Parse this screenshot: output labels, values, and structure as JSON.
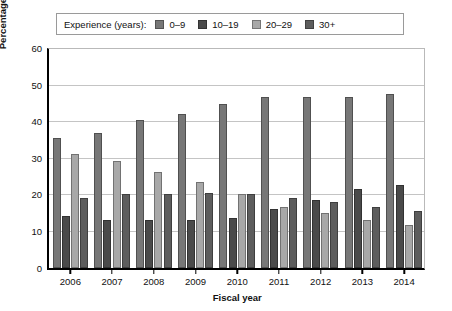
{
  "chart_data": {
    "type": "bar",
    "title": "",
    "xlabel": "Fiscal year",
    "ylabel": "Percentage of total civilian workforce",
    "categories": [
      "2006",
      "2007",
      "2008",
      "2009",
      "2010",
      "2011",
      "2012",
      "2013",
      "2014"
    ],
    "ylim": [
      0,
      60
    ],
    "yticks": [
      0,
      10,
      20,
      30,
      40,
      50,
      60
    ],
    "grid": true,
    "legend_position": "top",
    "legend_title": "Experience (years):",
    "series": [
      {
        "name": "0–9",
        "color": "#777777",
        "values": [
          35.5,
          36.7,
          40.3,
          42.0,
          44.8,
          46.5,
          46.7,
          46.7,
          47.5
        ]
      },
      {
        "name": "10–19",
        "color": "#4a4a4a",
        "values": [
          14.0,
          13.0,
          13.0,
          13.0,
          13.5,
          16.0,
          18.5,
          21.5,
          22.5
        ]
      },
      {
        "name": "20–29",
        "color": "#a8a8a8",
        "values": [
          31.0,
          29.0,
          26.0,
          23.5,
          20.0,
          16.5,
          15.0,
          13.0,
          11.5
        ]
      },
      {
        "name": "30+",
        "color": "#5d5d5d",
        "values": [
          19.0,
          20.0,
          20.0,
          20.5,
          20.0,
          19.0,
          18.0,
          16.5,
          15.5
        ]
      }
    ]
  }
}
